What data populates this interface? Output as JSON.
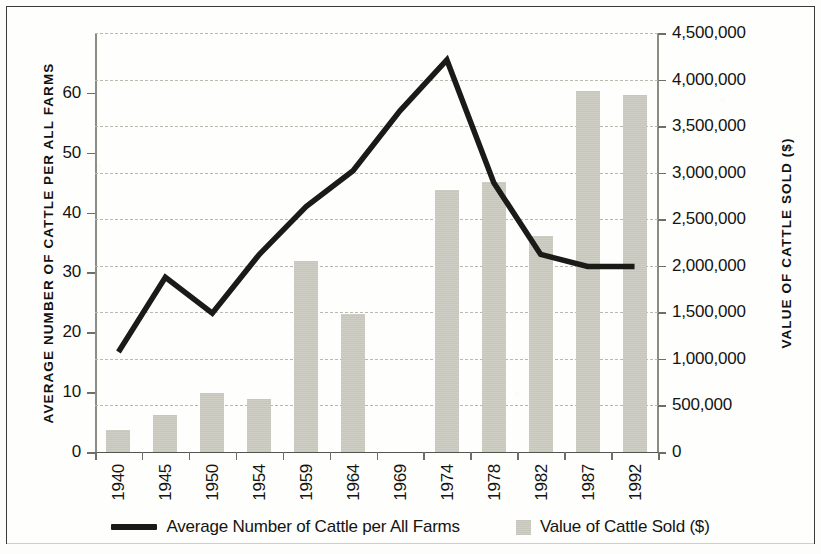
{
  "chart_data": {
    "type": "bar",
    "title": "",
    "subtitle": "",
    "xlabel": "",
    "categories": [
      "1940",
      "1945",
      "1950",
      "1954",
      "1959",
      "1964",
      "1969",
      "1974",
      "1978",
      "1982",
      "1987",
      "1992"
    ],
    "grid": true,
    "legend_position": "bottom",
    "axes": {
      "left": {
        "label": "AVERAGE NUMBER OF CATTLE PER ALL FARMS",
        "ylim": [
          0,
          70
        ],
        "tick_step": 10,
        "tick_labels": [
          "0",
          "10",
          "20",
          "30",
          "40",
          "50",
          "60"
        ],
        "tick_values": [
          0,
          10,
          20,
          30,
          40,
          50,
          60
        ]
      },
      "right": {
        "label": "VALUE OF CATTLE SOLD ($)",
        "ylim": [
          0,
          4500000
        ],
        "tick_step": 500000,
        "tick_labels": [
          "0",
          "500,000",
          "1,000,000",
          "1,500,000",
          "2,000,000",
          "2,500,000",
          "3,000,000",
          "3,500,000",
          "4,000,000",
          "4,500,000"
        ],
        "tick_values": [
          0,
          500000,
          1000000,
          1500000,
          2000000,
          2500000,
          3000000,
          3500000,
          4000000,
          4500000
        ]
      }
    },
    "series": [
      {
        "name": "Average Number of Cattle per All Farms",
        "type": "line",
        "axis": "left",
        "color": "#1a1a16",
        "values": [
          16.7,
          29.2,
          23.2,
          33.0,
          41.0,
          47.0,
          57.0,
          65.5,
          45.0,
          33.0,
          31.0,
          31.0
        ]
      },
      {
        "name": "Value of Cattle Sold ($)",
        "type": "bar",
        "axis": "right",
        "color": "#cdcdc4",
        "values": [
          235000,
          400000,
          635000,
          570000,
          2050000,
          1480000,
          null,
          2810000,
          2900000,
          2320000,
          3880000,
          3830000
        ]
      }
    ]
  },
  "legend": {
    "items": [
      {
        "label": "Average Number of Cattle per All Farms",
        "marker": "line-swatch",
        "color": "#1a1a16"
      },
      {
        "label": "Value of Cattle Sold ($)",
        "marker": "bar-swatch",
        "color": "#cdcdc4"
      }
    ]
  }
}
